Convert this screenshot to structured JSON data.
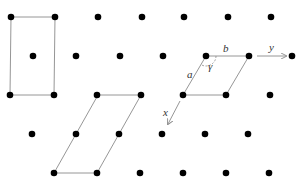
{
  "diagram": {
    "type": "2D lattice with unit cells",
    "colors": {
      "dot": "#000000",
      "line": "#8a8a8a",
      "label": "#333333",
      "background": "#ffffff"
    },
    "lattice_points": [
      [
        11,
        17
      ],
      [
        55,
        17
      ],
      [
        98,
        17
      ],
      [
        142,
        17
      ],
      [
        184,
        17
      ],
      [
        228,
        17
      ],
      [
        271,
        17
      ],
      [
        33,
        56
      ],
      [
        76,
        56
      ],
      [
        120,
        56
      ],
      [
        163,
        56
      ],
      [
        206,
        56
      ],
      [
        249,
        56
      ],
      [
        292,
        56
      ],
      [
        10,
        95
      ],
      [
        54,
        95
      ],
      [
        97,
        95
      ],
      [
        141,
        95
      ],
      [
        183,
        95
      ],
      [
        226,
        95
      ],
      [
        270,
        95
      ],
      [
        32,
        134
      ],
      [
        76,
        134
      ],
      [
        119,
        134
      ],
      [
        162,
        134
      ],
      [
        205,
        134
      ],
      [
        248,
        134
      ],
      [
        54,
        173
      ],
      [
        97,
        173
      ],
      [
        140,
        173
      ],
      [
        183,
        173
      ],
      [
        226,
        173
      ],
      [
        269,
        173
      ]
    ],
    "cells": [
      {
        "name": "centered-rectangular-cell",
        "points": [
          [
            11,
            17
          ],
          [
            55,
            17
          ],
          [
            54,
            95
          ],
          [
            10,
            95
          ]
        ]
      },
      {
        "name": "elongated-parallelogram-cell",
        "points": [
          [
            98,
            95
          ],
          [
            141,
            95
          ],
          [
            97,
            173
          ],
          [
            54,
            173
          ]
        ]
      },
      {
        "name": "primitive-cell",
        "points": [
          [
            206,
            56
          ],
          [
            249,
            56
          ],
          [
            226,
            95
          ],
          [
            183,
            95
          ]
        ]
      }
    ],
    "labels": {
      "a": "a",
      "b": "b",
      "gamma": "γ",
      "x": "x",
      "y": "y"
    },
    "label_positions": {
      "a": [
        187,
        78
      ],
      "b": [
        223,
        52
      ],
      "gamma": [
        208,
        70
      ],
      "x": [
        163,
        116
      ],
      "y": [
        269,
        51
      ]
    },
    "arrows": {
      "x_axis": {
        "from": [
          180,
          101
        ],
        "to": [
          168,
          124
        ]
      },
      "y_axis": {
        "from": [
          257,
          56
        ],
        "to": [
          286,
          56
        ]
      }
    },
    "angle_arc": {
      "center": [
        206,
        56
      ],
      "radius": 10
    }
  }
}
